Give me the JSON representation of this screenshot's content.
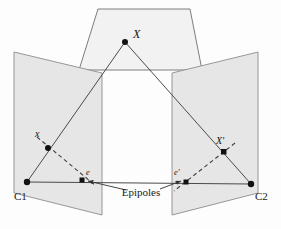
{
  "figure": {
    "name": "epipolar-geometry-diagram",
    "type": "diagram",
    "background_color": "#fdfdfd",
    "line_color": "#555555",
    "plane_fill": "#e8e8e8",
    "plane_stroke": "#8a8a8a",
    "point_color": "#111111",
    "dashed_color": "#4a4a4a"
  },
  "labels": {
    "scene_point": "X",
    "left_image_point": "x",
    "right_image_point": "X'",
    "left_epipole": "e",
    "right_epipole": "e'",
    "left_camera": "C1",
    "right_camera": "C2",
    "epipoles_caption": "Epipoles"
  },
  "geometry": {
    "scene_plane": {
      "name": "scene-plane",
      "points": "98,9 190,9 202,70 79,70"
    },
    "left_image_plane": {
      "name": "left-image-plane",
      "points": "14,52 102,73 102,215 14,193"
    },
    "right_image_plane": {
      "name": "right-image-plane",
      "points": "258,52 172,73 172,215 258,193"
    },
    "points": {
      "scene_point_xy": [
        125,
        42
      ],
      "left_image_point_xy": [
        48,
        148
      ],
      "right_image_point_xy": [
        224,
        152
      ],
      "left_epipole_xy": [
        82,
        180
      ],
      "right_epipole_xy": [
        186,
        182
      ],
      "left_camera_xy": [
        27,
        182
      ],
      "right_camera_xy": [
        251,
        184
      ]
    },
    "rays": {
      "scene_to_left_camera": "125,42 27,182",
      "scene_to_right_camera": "125,42 251,184",
      "baseline": "27,182 251,184"
    },
    "epipolar_lines": {
      "left": "37,137 96,186",
      "right": "235,143 174,191"
    },
    "caption_leaders": {
      "left_arrow": "126,190 88,181",
      "right_arrow": "160,189 181,181"
    }
  },
  "caption_position": {
    "x": 141,
    "y": 196
  }
}
